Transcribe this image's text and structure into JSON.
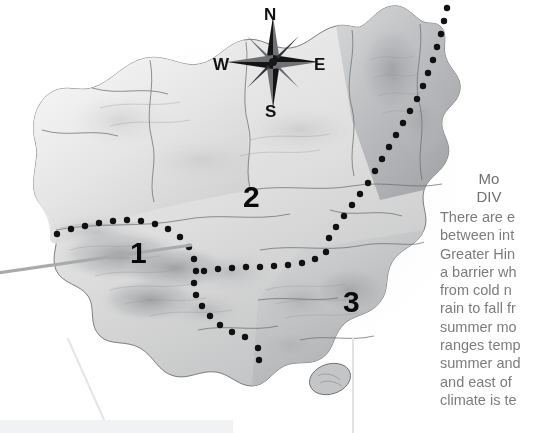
{
  "figure": {
    "type": "physical-relief-map",
    "style": "grayscale shaded relief"
  },
  "compass": {
    "name": "compass-rose",
    "points": 8,
    "north": "N",
    "south": "S",
    "east": "E",
    "west": "W"
  },
  "regions": [
    {
      "id": "1",
      "label": "1"
    },
    {
      "id": "2",
      "label": "2"
    },
    {
      "id": "3",
      "label": "3"
    }
  ],
  "boundaries": {
    "style": "dotted",
    "color": "#111111",
    "description": "dotted divides separating the three numbered regions"
  },
  "text_panel": {
    "heading_line1": "Mo",
    "heading_line2": "DIV",
    "body_lines": [
      "There are e",
      "between int",
      "Greater Hin",
      "a barrier wh",
      "from cold n",
      "rain to fall fr",
      "summer mo",
      "ranges temp",
      "summer and",
      "and east of",
      "climate is te"
    ]
  },
  "colors": {
    "map_light": "#f2f2f2",
    "map_mid": "#c9c9c9",
    "map_dark": "#8e9093",
    "text_gray": "#7a7d80",
    "heading_gray": "#6e7174",
    "ink": "#111111",
    "leader_line": "#b9bcbe",
    "callout_fill": "#f1f2f3"
  }
}
